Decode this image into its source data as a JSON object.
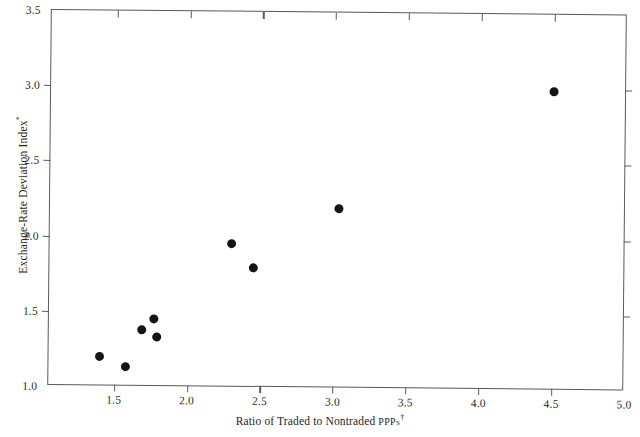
{
  "chart_data": {
    "type": "scatter",
    "title": "",
    "xlabel": "Ratio of Traded to Nontraded PPPs†",
    "xlabel_main": "Ratio of Traded to Nontraded ",
    "xlabel_smallcaps": "PPPs",
    "xlabel_marker": "†",
    "ylabel": "Exchange-Rate Deviation Index*",
    "ylabel_main": "Exchange-Rate Deviation Index",
    "ylabel_marker": "*",
    "xlim": [
      1.05,
      5.0
    ],
    "ylim": [
      1.0,
      3.5
    ],
    "xticks": [
      1.5,
      2.0,
      2.5,
      3.0,
      3.5,
      4.0,
      4.5,
      5.0
    ],
    "xticklabels": [
      "1.5",
      "2.0",
      "2.5",
      "3.0",
      "3.5",
      "4.0",
      "4.5",
      "5.0"
    ],
    "yticks": [
      1.0,
      1.5,
      2.0,
      2.5,
      3.0,
      3.5
    ],
    "yticklabels": [
      "1.0",
      "1.5",
      "2.0",
      "2.5",
      "3.0",
      "3.5"
    ],
    "grid": false,
    "legend": null,
    "marker": "filled-circle",
    "marker_color": "#141414",
    "frame_color": "#5a5a5a",
    "background": "#ffffff",
    "points": [
      {
        "x": 1.4,
        "y": 1.2
      },
      {
        "x": 1.58,
        "y": 1.13
      },
      {
        "x": 1.69,
        "y": 1.38
      },
      {
        "x": 1.77,
        "y": 1.45
      },
      {
        "x": 1.79,
        "y": 1.33
      },
      {
        "x": 2.3,
        "y": 1.96
      },
      {
        "x": 2.45,
        "y": 1.8
      },
      {
        "x": 3.03,
        "y": 2.2
      },
      {
        "x": 4.5,
        "y": 2.99
      }
    ]
  }
}
